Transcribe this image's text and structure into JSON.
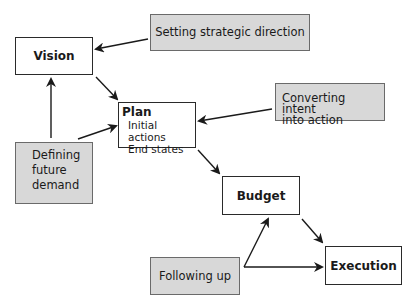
{
  "diagram": {
    "nodes": {
      "vision": {
        "label": "Vision"
      },
      "plan": {
        "label": "Plan",
        "items": [
          "Initial actions",
          "End states"
        ]
      },
      "budget": {
        "label": "Budget"
      },
      "execution": {
        "label": "Execution"
      }
    },
    "annotations": {
      "setting": {
        "label": "Setting strategic direction"
      },
      "converting": {
        "line1": "Converting intent",
        "line2": "into action"
      },
      "defining": {
        "line1": "Defining",
        "line2": "future",
        "line3": "demand"
      },
      "following": {
        "label": "Following up"
      }
    },
    "edges": [
      {
        "from": "Setting strategic direction",
        "to": "Vision"
      },
      {
        "from": "Vision",
        "to": "Plan"
      },
      {
        "from": "Defining future demand",
        "to": "Vision"
      },
      {
        "from": "Defining future demand",
        "to": "Plan"
      },
      {
        "from": "Converting intent into action",
        "to": "Plan"
      },
      {
        "from": "Plan",
        "to": "Budget"
      },
      {
        "from": "Budget",
        "to": "Execution"
      },
      {
        "from": "Following up",
        "to": "Budget"
      },
      {
        "from": "Following up",
        "to": "Execution"
      }
    ],
    "colors": {
      "box_fill": "#ffffff",
      "annotation_fill": "#d8d8d8",
      "stroke": "#2a2a2a"
    }
  }
}
